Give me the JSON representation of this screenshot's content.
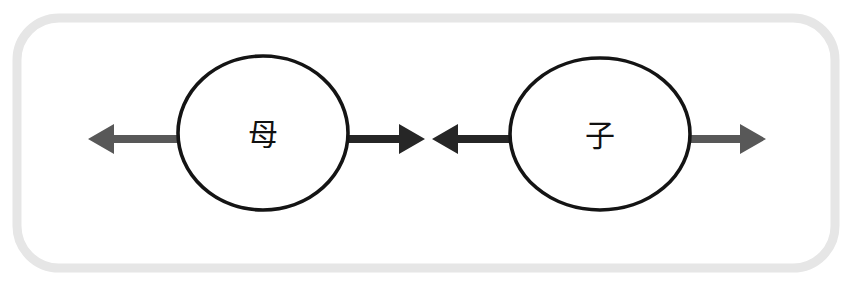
{
  "diagram": {
    "type": "node-link-diagram",
    "title_visible": false,
    "canvas": {
      "width": 856,
      "height": 283,
      "background": "#ffffff"
    },
    "frame": {
      "name": "rounded-panel-border",
      "color": "#e6e6e6",
      "stroke_width": 9,
      "corner_radius": 42,
      "x": 17,
      "y": 18,
      "width": 818,
      "height": 250
    },
    "nodes": [
      {
        "id": "node-mother",
        "label": "母",
        "meaning_hint": "mother",
        "shape": "ellipse",
        "cx": 263,
        "cy": 133,
        "rx": 85,
        "ry": 77,
        "stroke": "#141414",
        "stroke_width": 3.6,
        "fill": "#ffffff",
        "label_color": "#111111",
        "label_font_size": 30
      },
      {
        "id": "node-child",
        "label": "子",
        "meaning_hint": "child",
        "shape": "ellipse",
        "cx": 600,
        "cy": 134,
        "rx": 90,
        "ry": 76,
        "stroke": "#141414",
        "stroke_width": 3.6,
        "fill": "#ffffff",
        "label_color": "#111111",
        "label_font_size": 30
      }
    ],
    "arrows": [
      {
        "id": "arrow-mother-outgoing-left",
        "direction": "left",
        "color": "#585858",
        "tail_x": 178,
        "tip_x": 88,
        "y": 139,
        "shaft_thickness": 8,
        "head_length": 26,
        "head_half_width": 15,
        "from_node": "node-mother",
        "to_node": null
      },
      {
        "id": "arrow-mother-outgoing-right",
        "direction": "right",
        "color": "#262626",
        "tail_x": 345,
        "tip_x": 425,
        "y": 139,
        "shaft_thickness": 8,
        "head_length": 26,
        "head_half_width": 15,
        "from_node": "node-mother",
        "to_node": null
      },
      {
        "id": "arrow-child-outgoing-left",
        "direction": "left",
        "color": "#262626",
        "tail_x": 512,
        "tip_x": 432,
        "y": 139,
        "shaft_thickness": 8,
        "head_length": 26,
        "head_half_width": 15,
        "from_node": "node-child",
        "to_node": null
      },
      {
        "id": "arrow-child-outgoing-right",
        "direction": "right",
        "color": "#585858",
        "tail_x": 688,
        "tip_x": 766,
        "y": 139,
        "shaft_thickness": 8,
        "head_length": 26,
        "head_half_width": 15,
        "from_node": "node-child",
        "to_node": null
      }
    ],
    "colors": {
      "frame": "#e6e6e6",
      "node_stroke": "#141414",
      "node_fill": "#ffffff",
      "arrow_dark": "#262626",
      "arrow_gray": "#585858",
      "label": "#111111",
      "background": "#ffffff"
    }
  }
}
